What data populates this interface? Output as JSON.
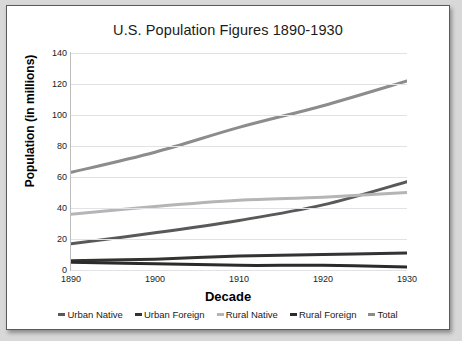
{
  "chart_data": {
    "type": "line",
    "title": "U.S. Population Figures 1890-1930",
    "xlabel": "Decade",
    "ylabel": "Population (in millions)",
    "x": [
      1890,
      1900,
      1910,
      1920,
      1930
    ],
    "xticklabels": [
      "1890",
      "1900",
      "1910",
      "1920",
      "1930"
    ],
    "yticklabels": [
      "0",
      "20",
      "40",
      "60",
      "80",
      "100",
      "120",
      "140"
    ],
    "yticks": [
      0,
      20,
      40,
      60,
      80,
      100,
      120,
      140
    ],
    "ylim": [
      0,
      140
    ],
    "xlim": [
      1890,
      1930
    ],
    "grid": "horizontal",
    "legend_position": "bottom",
    "series": [
      {
        "name": "Urban Native",
        "color": "#595959",
        "values": [
          17,
          24,
          32,
          42,
          57
        ]
      },
      {
        "name": "Urban Foreign",
        "color": "#333333",
        "values": [
          6,
          7,
          9,
          10,
          11
        ]
      },
      {
        "name": "Rural Native",
        "color": "#b5b5b5",
        "values": [
          36,
          41,
          45,
          47,
          50
        ]
      },
      {
        "name": "Rural Foreign",
        "color": "#2b2b2b",
        "values": [
          5,
          4,
          3,
          3,
          2
        ]
      },
      {
        "name": "Total",
        "color": "#8c8c8c",
        "values": [
          63,
          76,
          92,
          106,
          122
        ]
      }
    ]
  },
  "colors": {
    "page_background": "#d8d8d8",
    "figure_background": "#ffffff",
    "frame_border": "#5a5a5a",
    "gridline": "#e2e2e6",
    "axis_line": "#bdbdbd",
    "text": "#1b1b1b"
  }
}
